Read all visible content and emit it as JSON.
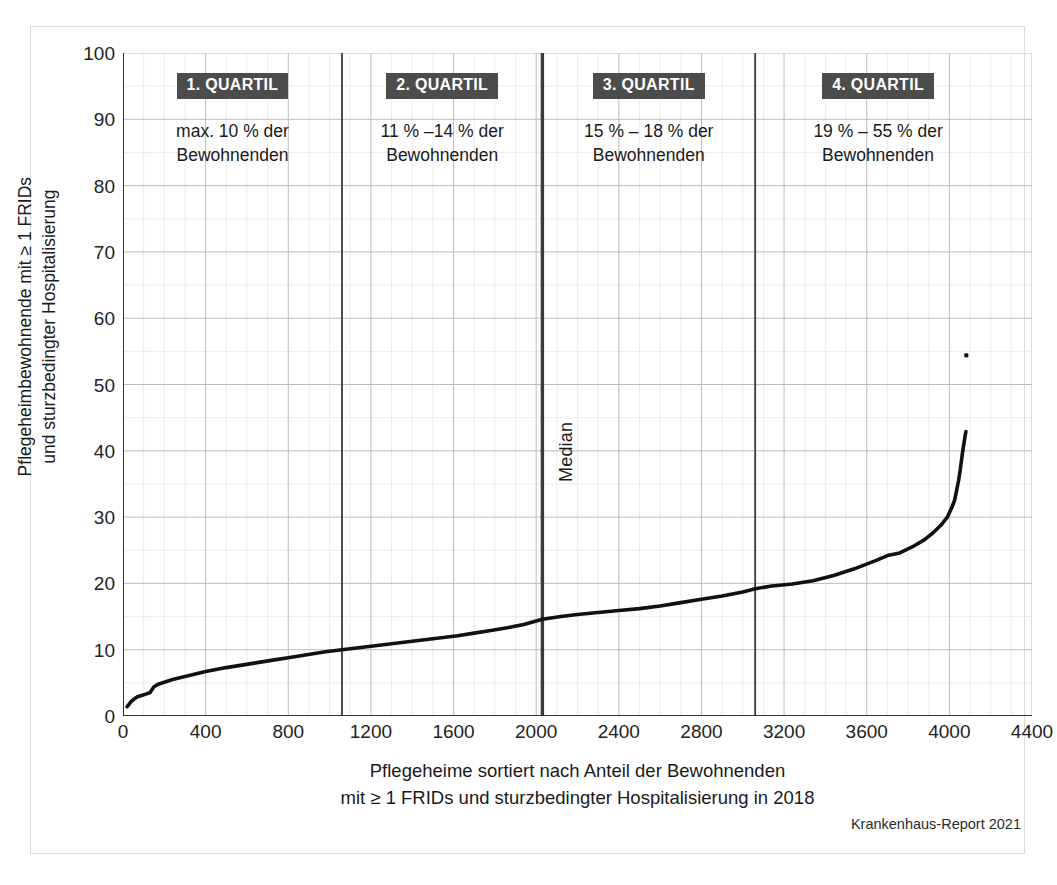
{
  "figure": {
    "source_note": "Krankenhaus-Report 2021"
  },
  "chart_data": {
    "type": "line",
    "title": "",
    "xlabel_line1": "Pflegeheime sortiert nach Anteil der Bewohnenden",
    "xlabel_line2": "mit ≥ 1 FRIDs und sturzbedingter Hospitalisierung in 2018",
    "ylabel_line1": "Pflegeheimbewohnende mit ≥ 1 FRIDs",
    "ylabel_line2": "und sturzbedingter Hospitalisierung",
    "xlim": [
      0,
      4400
    ],
    "ylim": [
      0,
      100
    ],
    "xticks": [
      0,
      400,
      800,
      1200,
      1600,
      2000,
      2400,
      2800,
      3200,
      3600,
      4000,
      4400
    ],
    "yticks": [
      0,
      10,
      20,
      30,
      40,
      50,
      60,
      70,
      80,
      90,
      100
    ],
    "x_minor_step": 100,
    "y_minor_step": 5,
    "grid": "major-and-minor",
    "legend": "none",
    "series_name": "Anteil Bewohnende mit ≥ 1 FRIDs und sturzbedingter Hospitalisierung",
    "series_color": "#111111",
    "points": [
      [
        20,
        1.4
      ],
      [
        30,
        1.8
      ],
      [
        40,
        2.2
      ],
      [
        55,
        2.6
      ],
      [
        70,
        2.9
      ],
      [
        90,
        3.1
      ],
      [
        110,
        3.3
      ],
      [
        130,
        3.5
      ],
      [
        150,
        4.4
      ],
      [
        170,
        4.8
      ],
      [
        200,
        5.1
      ],
      [
        240,
        5.5
      ],
      [
        280,
        5.8
      ],
      [
        320,
        6.1
      ],
      [
        360,
        6.4
      ],
      [
        400,
        6.7
      ],
      [
        450,
        7.0
      ],
      [
        500,
        7.3
      ],
      [
        560,
        7.6
      ],
      [
        620,
        7.9
      ],
      [
        680,
        8.2
      ],
      [
        740,
        8.5
      ],
      [
        800,
        8.8
      ],
      [
        860,
        9.1
      ],
      [
        920,
        9.4
      ],
      [
        980,
        9.7
      ],
      [
        1060,
        10.0
      ],
      [
        1140,
        10.3
      ],
      [
        1220,
        10.6
      ],
      [
        1300,
        10.9
      ],
      [
        1380,
        11.2
      ],
      [
        1460,
        11.5
      ],
      [
        1540,
        11.8
      ],
      [
        1620,
        12.1
      ],
      [
        1700,
        12.5
      ],
      [
        1780,
        12.9
      ],
      [
        1860,
        13.3
      ],
      [
        1940,
        13.8
      ],
      [
        2030,
        14.6
      ],
      [
        2120,
        15.0
      ],
      [
        2200,
        15.3
      ],
      [
        2300,
        15.6
      ],
      [
        2400,
        15.9
      ],
      [
        2500,
        16.2
      ],
      [
        2600,
        16.6
      ],
      [
        2700,
        17.1
      ],
      [
        2800,
        17.6
      ],
      [
        2900,
        18.1
      ],
      [
        3000,
        18.7
      ],
      [
        3060,
        19.2
      ],
      [
        3140,
        19.6
      ],
      [
        3240,
        19.9
      ],
      [
        3340,
        20.4
      ],
      [
        3440,
        21.2
      ],
      [
        3540,
        22.2
      ],
      [
        3640,
        23.4
      ],
      [
        3700,
        24.2
      ],
      [
        3760,
        24.6
      ],
      [
        3820,
        25.5
      ],
      [
        3880,
        26.6
      ],
      [
        3920,
        27.6
      ],
      [
        3960,
        28.8
      ],
      [
        3990,
        30.0
      ],
      [
        4010,
        31.3
      ],
      [
        4025,
        32.5
      ],
      [
        4035,
        34.0
      ],
      [
        4045,
        35.6
      ],
      [
        4052,
        37.0
      ],
      [
        4058,
        38.4
      ],
      [
        4063,
        39.6
      ],
      [
        4068,
        40.6
      ],
      [
        4072,
        41.4
      ],
      [
        4076,
        42.2
      ],
      [
        4080,
        42.9
      ]
    ],
    "outliers": [
      [
        4082,
        54.4
      ]
    ],
    "median_line": {
      "label": "Median",
      "x": 2030,
      "color": "#3a3a3a"
    },
    "quartile_dividers": [
      {
        "x": 1060,
        "color": "#3a3a3a"
      },
      {
        "x": 2030,
        "color": "#3a3a3a"
      },
      {
        "x": 3060,
        "color": "#3a3a3a"
      }
    ]
  },
  "quartiles": [
    {
      "badge": "1. QUARTIL",
      "desc_line1": "max. 10 % der",
      "desc_line2": "Bewohnenden"
    },
    {
      "badge": "2. QUARTIL",
      "desc_line1": "11 % –14 % der",
      "desc_line2": "Bewohnenden"
    },
    {
      "badge": "3. QUARTIL",
      "desc_line1": "15 % – 18 % der",
      "desc_line2": "Bewohnenden"
    },
    {
      "badge": "4. QUARTIL",
      "desc_line1": "19 % – 55 % der",
      "desc_line2": "Bewohnenden"
    }
  ]
}
